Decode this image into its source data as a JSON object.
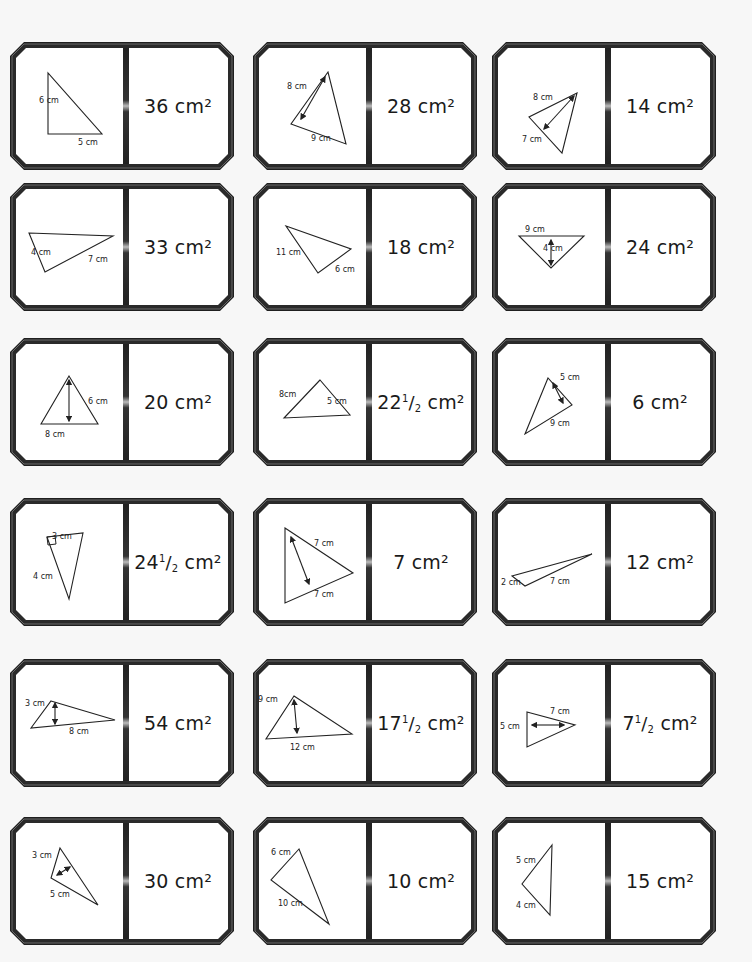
{
  "page": {
    "background": "#f7f7f7",
    "frame_color": "#1c1c1c"
  },
  "dominoes": [
    {
      "id": 1,
      "row": 1,
      "col": 1,
      "x": 10,
      "y": 42,
      "answer": {
        "whole": "36",
        "num": "",
        "den": "",
        "unit": "cm²"
      },
      "labels": [
        "6 cm",
        "5 cm"
      ]
    },
    {
      "id": 2,
      "row": 1,
      "col": 2,
      "x": 253,
      "y": 42,
      "answer": {
        "whole": "28",
        "num": "",
        "den": "",
        "unit": "cm²"
      },
      "labels": [
        "8 cm",
        "9 cm"
      ]
    },
    {
      "id": 3,
      "row": 1,
      "col": 3,
      "x": 492,
      "y": 42,
      "answer": {
        "whole": "14",
        "num": "",
        "den": "",
        "unit": "cm²"
      },
      "labels": [
        "8 cm",
        "7 cm"
      ]
    },
    {
      "id": 4,
      "row": 2,
      "col": 1,
      "x": 10,
      "y": 183,
      "answer": {
        "whole": "33",
        "num": "",
        "den": "",
        "unit": "cm²"
      },
      "labels": [
        "4 cm",
        "7 cm"
      ]
    },
    {
      "id": 5,
      "row": 2,
      "col": 2,
      "x": 253,
      "y": 183,
      "answer": {
        "whole": "18",
        "num": "",
        "den": "",
        "unit": "cm²"
      },
      "labels": [
        "11 cm",
        "6 cm"
      ]
    },
    {
      "id": 6,
      "row": 2,
      "col": 3,
      "x": 492,
      "y": 183,
      "answer": {
        "whole": "24",
        "num": "",
        "den": "",
        "unit": "cm²"
      },
      "labels": [
        "9 cm",
        "4 cm"
      ]
    },
    {
      "id": 7,
      "row": 3,
      "col": 1,
      "x": 10,
      "y": 338,
      "answer": {
        "whole": "20",
        "num": "",
        "den": "",
        "unit": "cm²"
      },
      "labels": [
        "6 cm",
        "8 cm"
      ]
    },
    {
      "id": 8,
      "row": 3,
      "col": 2,
      "x": 253,
      "y": 338,
      "answer": {
        "whole": "22",
        "num": "1",
        "den": "2",
        "unit": "cm²"
      },
      "labels": [
        "8cm",
        "5 cm"
      ]
    },
    {
      "id": 9,
      "row": 3,
      "col": 3,
      "x": 492,
      "y": 338,
      "answer": {
        "whole": "6",
        "num": "",
        "den": "",
        "unit": "cm²"
      },
      "labels": [
        "5 cm",
        "9 cm"
      ]
    },
    {
      "id": 10,
      "row": 4,
      "col": 1,
      "x": 10,
      "y": 498,
      "answer": {
        "whole": "24",
        "num": "1",
        "den": "2",
        "unit": "cm²"
      },
      "labels": [
        "3 cm",
        "4 cm"
      ]
    },
    {
      "id": 11,
      "row": 4,
      "col": 2,
      "x": 253,
      "y": 498,
      "answer": {
        "whole": "7",
        "num": "",
        "den": "",
        "unit": "cm²"
      },
      "labels": [
        "7 cm",
        "7 cm"
      ]
    },
    {
      "id": 12,
      "row": 4,
      "col": 3,
      "x": 492,
      "y": 498,
      "answer": {
        "whole": "12",
        "num": "",
        "den": "",
        "unit": "cm²"
      },
      "labels": [
        "2 cm",
        "7 cm"
      ]
    },
    {
      "id": 13,
      "row": 5,
      "col": 1,
      "x": 10,
      "y": 659,
      "answer": {
        "whole": "54",
        "num": "",
        "den": "",
        "unit": "cm²"
      },
      "labels": [
        "3 cm",
        "8 cm"
      ]
    },
    {
      "id": 14,
      "row": 5,
      "col": 2,
      "x": 253,
      "y": 659,
      "answer": {
        "whole": "17",
        "num": "1",
        "den": "2",
        "unit": "cm²"
      },
      "labels": [
        "9 cm",
        "12 cm"
      ]
    },
    {
      "id": 15,
      "row": 5,
      "col": 3,
      "x": 492,
      "y": 659,
      "answer": {
        "whole": "7",
        "num": "1",
        "den": "2",
        "unit": "cm²"
      },
      "labels": [
        "7 cm",
        "5 cm"
      ]
    },
    {
      "id": 16,
      "row": 6,
      "col": 1,
      "x": 10,
      "y": 817,
      "answer": {
        "whole": "30",
        "num": "",
        "den": "",
        "unit": "cm²"
      },
      "labels": [
        "3 cm",
        "5 cm"
      ]
    },
    {
      "id": 17,
      "row": 6,
      "col": 2,
      "x": 253,
      "y": 817,
      "answer": {
        "whole": "10",
        "num": "",
        "den": "",
        "unit": "cm²"
      },
      "labels": [
        "6 cm",
        "10 cm"
      ]
    },
    {
      "id": 18,
      "row": 6,
      "col": 3,
      "x": 492,
      "y": 817,
      "answer": {
        "whole": "15",
        "num": "",
        "den": "",
        "unit": "cm²"
      },
      "labels": [
        "5 cm",
        "4 cm"
      ]
    }
  ]
}
